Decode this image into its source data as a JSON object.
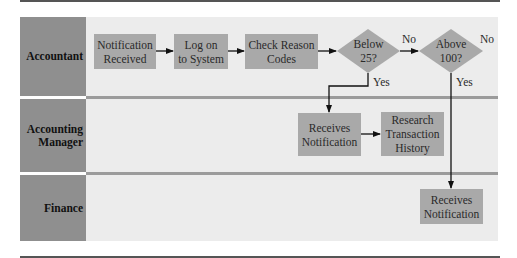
{
  "diagram": {
    "type": "swimlane-flowchart",
    "lanes": [
      {
        "id": "accountant",
        "label": "Accountant"
      },
      {
        "id": "accounting-manager",
        "label": "Accounting Manager",
        "label_lines": [
          "Accounting",
          "Manager"
        ]
      },
      {
        "id": "finance",
        "label": "Finance"
      }
    ],
    "nodes": {
      "notification_received": {
        "lines": [
          "Notification",
          "Received"
        ],
        "shape": "rect",
        "lane": "accountant"
      },
      "log_on": {
        "lines": [
          "Log on",
          "to System"
        ],
        "shape": "rect",
        "lane": "accountant"
      },
      "check_reason": {
        "lines": [
          "Check Reason",
          "Codes"
        ],
        "shape": "rect",
        "lane": "accountant"
      },
      "below_25": {
        "lines": [
          "Below",
          "25?"
        ],
        "shape": "diamond",
        "lane": "accountant"
      },
      "above_100": {
        "lines": [
          "Above",
          "100?"
        ],
        "shape": "diamond",
        "lane": "accountant"
      },
      "mgr_receives": {
        "lines": [
          "Receives",
          "Notification"
        ],
        "shape": "rect",
        "lane": "accounting-manager"
      },
      "research_history": {
        "lines": [
          "Research",
          "Transaction",
          "History"
        ],
        "shape": "rect",
        "lane": "accounting-manager"
      },
      "fin_receives": {
        "lines": [
          "Receives",
          "Notification"
        ],
        "shape": "rect",
        "lane": "finance"
      }
    },
    "edge_labels": {
      "below_no": "No",
      "below_yes": "Yes",
      "above_no": "No",
      "above_yes": "Yes"
    },
    "edges": [
      {
        "from": "notification_received",
        "to": "log_on"
      },
      {
        "from": "log_on",
        "to": "check_reason"
      },
      {
        "from": "check_reason",
        "to": "below_25"
      },
      {
        "from": "below_25",
        "to": "above_100",
        "label": "No"
      },
      {
        "from": "below_25",
        "to": "mgr_receives",
        "label": "Yes"
      },
      {
        "from": "mgr_receives",
        "to": "research_history"
      },
      {
        "from": "above_100",
        "to": "fin_receives",
        "label": "Yes"
      },
      {
        "from": "above_100",
        "to": null,
        "label": "No"
      }
    ],
    "colors": {
      "lane_label_bg": "#8f8f8f",
      "lane_bg": "#ececec",
      "node_fill": "#a9a9a9",
      "divider": "#9b9b9b",
      "line": "#111111"
    }
  }
}
